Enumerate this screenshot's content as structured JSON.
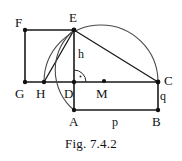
{
  "figure": {
    "caption": "Fig. 7.4.2",
    "stroke_color": "#1a1a1a",
    "background_color": "#ffffff",
    "points": [
      {
        "id": "F",
        "label": "F",
        "x": 25,
        "y": 30,
        "label_x": 15,
        "label_y": 16,
        "dot": true
      },
      {
        "id": "E",
        "label": "E",
        "x": 74,
        "y": 30,
        "label_x": 69,
        "label_y": 12,
        "dot": true
      },
      {
        "id": "G",
        "label": "G",
        "x": 25,
        "y": 82,
        "label_x": 16,
        "label_y": 88,
        "dot": true
      },
      {
        "id": "H",
        "label": "H",
        "x": 44,
        "y": 82,
        "label_x": 36,
        "label_y": 88,
        "dot": true
      },
      {
        "id": "D",
        "label": "D",
        "x": 74,
        "y": 82,
        "label_x": 64,
        "label_y": 88,
        "dot": true
      },
      {
        "id": "M",
        "label": "M",
        "x": 104,
        "y": 82,
        "label_x": 96,
        "label_y": 88,
        "dot": true
      },
      {
        "id": "C",
        "label": "C",
        "x": 158,
        "y": 82,
        "label_x": 165,
        "label_y": 75,
        "dot": true
      },
      {
        "id": "A",
        "label": "A",
        "x": 74,
        "y": 110,
        "label_x": 69,
        "label_y": 116,
        "dot": true
      },
      {
        "id": "B",
        "label": "B",
        "x": 158,
        "y": 110,
        "label_x": 153,
        "label_y": 116,
        "dot": true
      }
    ],
    "segment_labels": [
      {
        "id": "h",
        "label": "h",
        "x": 79,
        "y": 48
      },
      {
        "id": "q",
        "label": "q",
        "x": 161,
        "y": 90
      },
      {
        "id": "p",
        "label": "p",
        "x": 113,
        "y": 116
      }
    ],
    "segments": [
      {
        "id": "FE",
        "from": "F",
        "to": "E"
      },
      {
        "id": "FG",
        "from": "F",
        "to": "G"
      },
      {
        "id": "GC",
        "from": "G",
        "to": "C"
      },
      {
        "id": "ED",
        "from": "E",
        "to": "D"
      },
      {
        "id": "EC",
        "from": "E",
        "to": "C"
      },
      {
        "id": "EH",
        "from": "E",
        "to": "H"
      },
      {
        "id": "DA",
        "from": "D",
        "to": "A"
      },
      {
        "id": "AB",
        "from": "A",
        "to": "B"
      },
      {
        "id": "BC",
        "from": "B",
        "to": "C"
      }
    ],
    "arcs": [
      {
        "id": "semicircle-HEC",
        "description": "semicircle on diameter HC through E, centre M"
      },
      {
        "id": "arc-EHA",
        "description": "arc centred at D radius DE from E through H to A"
      }
    ],
    "right_angle_marker": {
      "id": "right-angle-at-D",
      "vertex": "D",
      "between": "ED and DC"
    }
  }
}
